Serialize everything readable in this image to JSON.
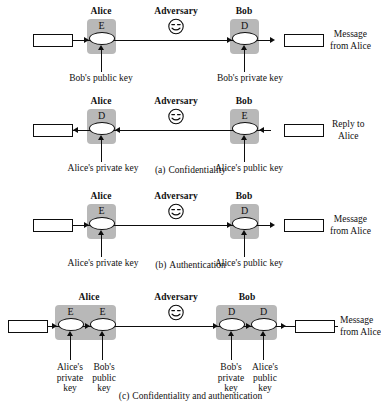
{
  "figure": {
    "colors": {
      "ink": "#0d0d0d",
      "grey_block": "#b8b8b8",
      "paper": "#ffffff"
    }
  },
  "labels": {
    "alice": "Alice",
    "bob": "Bob",
    "adversary": "Adversary",
    "encrypt": "E",
    "decrypt": "D"
  },
  "panels": [
    {
      "id": "a",
      "caption_letter": "(a)",
      "caption_text": "Confidentiality",
      "rows": [
        {
          "id": "a-row-1",
          "direction": "left-to-right",
          "sender": "Alice",
          "receiver": "Bob",
          "adversary": "Adversary",
          "sender_op": "E",
          "receiver_op": "D",
          "sender_key": "Bob's public key",
          "receiver_key": "Bob's private key",
          "output_note_line1": "Message",
          "output_note_line2": "from Alice"
        },
        {
          "id": "a-row-2",
          "direction": "right-to-left",
          "sender": "Bob",
          "receiver": "Alice",
          "adversary": "Adversary",
          "sender_op": "E",
          "receiver_op": "D",
          "sender_key": "Alice's public key",
          "receiver_key": "Alice's private key",
          "output_note_line1": "Reply to",
          "output_note_line2": "Alice"
        }
      ]
    },
    {
      "id": "b",
      "caption_letter": "(b)",
      "caption_text": "Authentication",
      "rows": [
        {
          "id": "b-row-1",
          "direction": "left-to-right",
          "sender": "Alice",
          "receiver": "Bob",
          "adversary": "Adversary",
          "sender_op": "E",
          "receiver_op": "D",
          "sender_key": "Alice's private key",
          "receiver_key": "Alice's public key",
          "output_note_line1": "Message",
          "output_note_line2": "from Alice"
        }
      ]
    },
    {
      "id": "c",
      "caption_letter": "(c)",
      "caption_text": "Confidentiality and authentication",
      "rows": [
        {
          "id": "c-row-1",
          "direction": "left-to-right",
          "sender": "Alice",
          "receiver": "Bob",
          "adversary": "Adversary",
          "sender_ops": [
            "E",
            "E"
          ],
          "receiver_ops": [
            "D",
            "D"
          ],
          "sender_keys": [
            {
              "l1": "Alice's",
              "l2": "private",
              "l3": "key"
            },
            {
              "l1": "Bob's",
              "l2": "public",
              "l3": "key"
            }
          ],
          "receiver_keys": [
            {
              "l1": "Bob's",
              "l2": "private",
              "l3": "key"
            },
            {
              "l1": "Alice's",
              "l2": "public",
              "l3": "key"
            }
          ],
          "output_note_line1": "Message",
          "output_note_line2": "from Alice"
        }
      ]
    }
  ]
}
